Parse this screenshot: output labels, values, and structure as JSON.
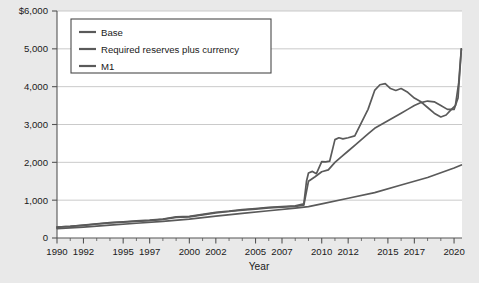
{
  "chart_data": {
    "type": "line",
    "title": "",
    "xlabel": "Year",
    "ylabel": "",
    "xlim": [
      1990,
      2020.6
    ],
    "ylim": [
      0,
      6000
    ],
    "grid": true,
    "legend_position": "top-left",
    "y_ticks": [
      0,
      1000,
      2000,
      3000,
      4000,
      5000,
      6000
    ],
    "y_tick_labels": [
      "0",
      "1,000",
      "2,000",
      "3,000",
      "4,000",
      "5,000",
      "$6,000"
    ],
    "x_ticks": [
      1990,
      1992,
      1995,
      1997,
      2000,
      2002,
      2005,
      2007,
      2010,
      2012,
      2015,
      2017,
      2020
    ],
    "x_tick_labels": [
      "1990",
      "1992",
      "1995",
      "1997",
      "2000",
      "2002",
      "2005",
      "2007",
      "2010",
      "2012",
      "2015",
      "2017",
      "2020"
    ],
    "x_minor_ticks": [
      1991,
      1993,
      1994,
      1996,
      1998,
      1999,
      2001,
      2003,
      2004,
      2006,
      2008,
      2009,
      2011,
      2013,
      2014,
      2016,
      2018,
      2019
    ],
    "line_color": "#5a5a5a",
    "series": [
      {
        "name": "Base",
        "x": [
          1990,
          1991,
          1992,
          1993,
          1994,
          1995,
          1996,
          1997,
          1998,
          1999,
          2000,
          2001,
          2002,
          2003,
          2004,
          2005,
          2006,
          2007,
          2008.0,
          2008.65,
          2008.85,
          2009.0,
          2009.3,
          2009.6,
          2010.0,
          2010.3,
          2010.6,
          2011.0,
          2011.3,
          2011.6,
          2012.0,
          2012.5,
          2013.0,
          2013.5,
          2014.0,
          2014.4,
          2014.8,
          2015.2,
          2015.6,
          2016.0,
          2016.5,
          2017.0,
          2017.5,
          2018.0,
          2018.5,
          2019.0,
          2019.4,
          2019.8,
          2020.1,
          2020.35,
          2020.55
        ],
        "values": [
          290,
          310,
          340,
          375,
          405,
          430,
          450,
          470,
          500,
          560,
          570,
          625,
          680,
          710,
          750,
          780,
          810,
          830,
          850,
          900,
          1500,
          1720,
          1760,
          1700,
          2020,
          2010,
          2030,
          2600,
          2650,
          2620,
          2650,
          2700,
          3050,
          3400,
          3900,
          4050,
          4080,
          3950,
          3900,
          3950,
          3850,
          3700,
          3600,
          3450,
          3300,
          3200,
          3250,
          3400,
          3500,
          4100,
          5000
        ]
      },
      {
        "name": "Required reserves plus currency",
        "x": [
          1990,
          1991,
          1992,
          1993,
          1994,
          1995,
          1996,
          1997,
          1998,
          1999,
          2000,
          2001,
          2002,
          2003,
          2004,
          2005,
          2006,
          2007,
          2008.0,
          2008.65,
          2009.0,
          2009.5,
          2010.0,
          2010.5,
          2011.0,
          2011.5,
          2012.0,
          2012.5,
          2013.0,
          2013.5,
          2014.0,
          2014.5,
          2015.0,
          2015.5,
          2016.0,
          2016.5,
          2017.0,
          2017.5,
          2018.0,
          2018.5,
          2019.0,
          2019.5,
          2020.0,
          2020.3,
          2020.55
        ],
        "values": [
          285,
          305,
          335,
          370,
          400,
          420,
          440,
          460,
          490,
          545,
          560,
          610,
          665,
          700,
          735,
          765,
          795,
          815,
          835,
          870,
          1500,
          1620,
          1750,
          1800,
          2000,
          2150,
          2300,
          2450,
          2600,
          2750,
          2900,
          3000,
          3100,
          3200,
          3300,
          3400,
          3500,
          3580,
          3620,
          3600,
          3500,
          3400,
          3400,
          3700,
          5000
        ]
      },
      {
        "name": "M1",
        "x": [
          1990,
          1991,
          1992,
          1993,
          1994,
          1995,
          1996,
          1997,
          1998,
          1999,
          2000,
          2001,
          2002,
          2003,
          2004,
          2005,
          2006,
          2007,
          2008,
          2009,
          2010,
          2011,
          2012,
          2013,
          2014,
          2015,
          2016,
          2017,
          2018,
          2019,
          2020
        ],
        "values": [
          800,
          860,
          950,
          1050,
          1130,
          1150,
          1120,
          1080,
          1090,
          1110,
          1100,
          1130,
          1190,
          1270,
          1340,
          1360,
          1370,
          1370,
          1400,
          1650,
          1700,
          1850,
          2200,
          2400,
          2600,
          2900,
          3100,
          3400,
          3600,
          3800,
          1950
        ]
      }
    ],
    "m1_render_override": {
      "comment": "M1 drawn as the lowest slowly-rising curve",
      "x": [
        1990,
        1992,
        1994,
        1996,
        1998,
        2000,
        2002,
        2004,
        2006,
        2008,
        2009,
        2010,
        2012,
        2014,
        2016,
        2018,
        2020,
        2020.55
      ],
      "values": [
        250,
        290,
        340,
        390,
        440,
        500,
        580,
        650,
        720,
        790,
        830,
        900,
        1050,
        1200,
        1400,
        1600,
        1850,
        1930
      ]
    }
  },
  "legend": {
    "items": [
      {
        "label": "Base"
      },
      {
        "label": "Required reserves plus currency"
      },
      {
        "label": "M1"
      }
    ]
  },
  "axes": {
    "x_title": "Year"
  }
}
